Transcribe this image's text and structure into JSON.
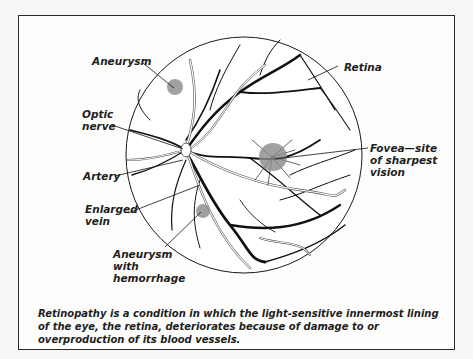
{
  "figure": {
    "labels": {
      "aneurysm": "Aneurysm",
      "optic_nerve": "Optic\nnerve",
      "artery": "Artery",
      "enlarged_vein": "Enlarged\nvein",
      "aneurysm_hemorrhage": "Aneurysm\nwith\nhemorrhage",
      "retina": "Retina",
      "fovea": "Fovea—site\nof sharpest\nvision"
    },
    "caption": "Retinopathy is a condition in which the light-sensitive innermost lining of the eye, the retina, deteriorates because of damage to or overproduction of its blood vessels.",
    "colors": {
      "vessel": "#111111",
      "lesion": "#8a8a8a",
      "frame": "#2a2a2a",
      "background": "#fdfdfb"
    }
  }
}
